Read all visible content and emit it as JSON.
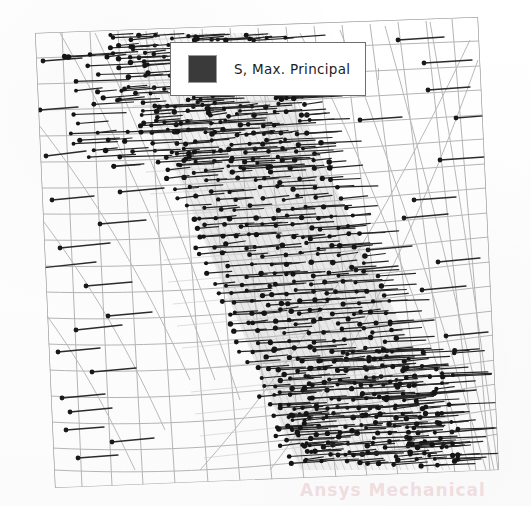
{
  "figure": {
    "type": "fea-vector-plot",
    "title_visible": false,
    "background_color": "#ffffff"
  },
  "legend": {
    "label": "S, Max. Principal",
    "swatch_color": "#3a3a3a",
    "swatch_border_color": "#9a9a9a",
    "border_color": "#6e6e6e",
    "background_color": "#ffffff",
    "position": "top-center"
  },
  "watermark": {
    "text": "Ansys Mechanical",
    "color": "#d6969e"
  },
  "mesh": {
    "line_color": "#b4b4b4",
    "dense_band_color": "#c9c9c9",
    "corners": {
      "top_left": [
        35,
        33
      ],
      "top_right": [
        478,
        17
      ],
      "bottom_right": [
        499,
        470
      ],
      "bottom_left": [
        55,
        488
      ]
    },
    "description": "curvilinear quadrilateral finite element mesh, refined along a diagonal band running from upper-left to lower-right"
  },
  "vectors": {
    "color": "#2b2b2b",
    "head_color": "#1a1a1a",
    "orientation": "predominantly horizontal",
    "description": "maximum principal stress direction vectors, densest along the refined diagonal band"
  },
  "chart_data": {
    "type": "scatter",
    "title": "",
    "subtitle": "",
    "xlabel": "",
    "ylabel": "",
    "legend_entries": [
      "S, Max. Principal"
    ],
    "legend_position": "top-center",
    "grid": false,
    "axis_ticks_visible": false,
    "annotations": []
  }
}
